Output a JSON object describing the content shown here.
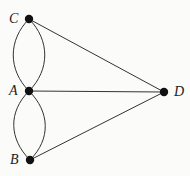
{
  "diagram": {
    "type": "graph",
    "title": "",
    "nodes": [
      {
        "id": "C",
        "label": "C",
        "x": 29,
        "y": 19
      },
      {
        "id": "A",
        "label": "A",
        "x": 29,
        "y": 91
      },
      {
        "id": "B",
        "label": "B",
        "x": 30,
        "y": 160
      },
      {
        "id": "D",
        "label": "D",
        "x": 164,
        "y": 92
      }
    ],
    "edges": [
      {
        "from": "C",
        "to": "A",
        "kind": "curve-left"
      },
      {
        "from": "C",
        "to": "A",
        "kind": "curve-right"
      },
      {
        "from": "A",
        "to": "B",
        "kind": "curve-left"
      },
      {
        "from": "A",
        "to": "B",
        "kind": "curve-right"
      },
      {
        "from": "C",
        "to": "D",
        "kind": "straight"
      },
      {
        "from": "A",
        "to": "D",
        "kind": "straight"
      },
      {
        "from": "B",
        "to": "D",
        "kind": "straight"
      }
    ],
    "colors": {
      "line": "#333333",
      "node": "#111111",
      "background": "#fbfbf9"
    }
  }
}
